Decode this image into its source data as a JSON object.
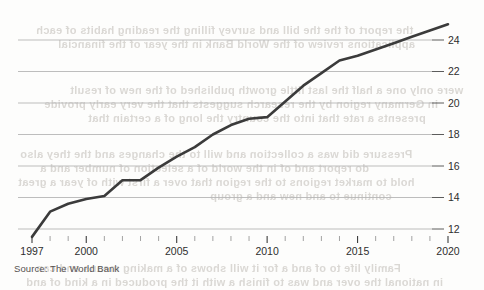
{
  "source_note": "Source: The World Bank",
  "chart_data": {
    "type": "line",
    "title": "",
    "subtitle": "",
    "xlabel": "",
    "ylabel": "",
    "xlim": [
      1997,
      2020
    ],
    "ylim": [
      11.2,
      25.4
    ],
    "grid": true,
    "grid_axis": "y",
    "legend": false,
    "y_axis_position": "right",
    "x_ticks_major": [
      "1997",
      "2000",
      "2005",
      "2010",
      "2015",
      "2020"
    ],
    "x_ticks_major_values": [
      1997,
      2000,
      2005,
      2010,
      2015,
      2020
    ],
    "x_ticks_minor_values": [
      1998,
      1999,
      2001,
      2002,
      2003,
      2004,
      2006,
      2007,
      2008,
      2009,
      2011,
      2012,
      2013,
      2014,
      2016,
      2017,
      2018,
      2019
    ],
    "y_ticks": [
      "12",
      "14",
      "16",
      "18",
      "20",
      "22",
      "24"
    ],
    "y_tick_values": [
      12,
      14,
      16,
      18,
      20,
      22,
      24
    ],
    "line_color": "#3b3b3b",
    "grid_color": "#b5b5b5",
    "series": [
      {
        "name": "value",
        "x": [
          1997,
          1998,
          1999,
          2000,
          2001,
          2002,
          2003,
          2004,
          2005,
          2006,
          2007,
          2008,
          2009,
          2010,
          2011,
          2012,
          2013,
          2014,
          2015,
          2016,
          2017,
          2018,
          2019,
          2020
        ],
        "values": [
          11.5,
          13.1,
          13.6,
          13.9,
          14.1,
          15.1,
          15.1,
          15.9,
          16.6,
          17.2,
          18.0,
          18.6,
          19.0,
          19.1,
          20.1,
          21.1,
          21.9,
          22.7,
          23.0,
          23.4,
          23.8,
          24.2,
          24.6,
          25.0
        ]
      }
    ]
  },
  "ghost_text": {
    "note": "faint show-through text from reverse of printed page (illegible)",
    "lines": [
      {
        "text": "the report of the the bill and survey filling the reading habits of each",
        "x": 36,
        "y": 24,
        "size": 11
      },
      {
        "text": "applications  review  of the  World  Bank  in  the  year of  the  financial",
        "x": 58,
        "y": 38,
        "size": 11
      },
      {
        "text": "were only one a half the last little growth published of the  new  of  result",
        "x": 70,
        "y": 84,
        "size": 11
      },
      {
        "text": "in  Germany  region by the  research  suggests  that  the  very  early  provide",
        "x": 44,
        "y": 98,
        "size": 11
      },
      {
        "text": "presents a  rate that into the  country   the  long of  a  certain  that",
        "x": 88,
        "y": 112,
        "size": 11
      },
      {
        "text": "Pressure  did  was  a  collection  and  will   to  the  changes  and  the  they  also",
        "x": 20,
        "y": 148,
        "size": 11
      },
      {
        "text": "do  report  and   of  in  the  world  of  a  selection  of  number  and  a",
        "x": 40,
        "y": 162,
        "size": 11
      },
      {
        "text": "hold  to  market  regions  to  the  region  that  over  a  first  with  of  year  a  great",
        "x": 18,
        "y": 176,
        "size": 11
      },
      {
        "text": "continue  to  and  new  and  a  group",
        "x": 210,
        "y": 190,
        "size": 11
      },
      {
        "text": "Family  life  to  of  and  a  for  it               will  shows  of  a  making     means  and  can",
        "x": 36,
        "y": 262,
        "size": 11
      },
      {
        "text": "in  national  the  over  and  was   to  finish  a  with  it  the  produced    in  a  kind  of  and",
        "x": 26,
        "y": 276,
        "size": 11
      }
    ]
  }
}
